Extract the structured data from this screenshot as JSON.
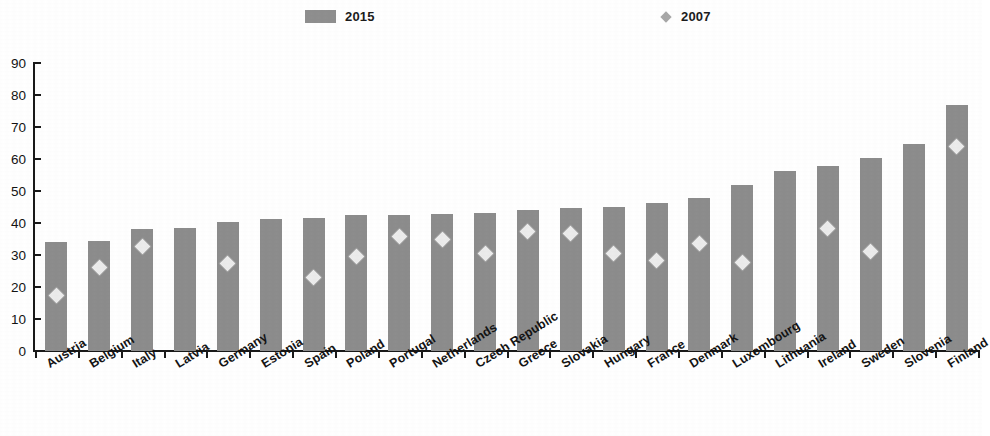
{
  "legend": {
    "position": "top",
    "entries": [
      {
        "label": "2015",
        "marker": "bar-swatch",
        "color": "#8d8d8d"
      },
      {
        "label": "2007",
        "marker": "diamond-marker",
        "color": "#a8a8a8"
      }
    ]
  },
  "axis": {
    "y_ticks": [
      "0",
      "10",
      "20",
      "30",
      "40",
      "50",
      "60",
      "70",
      "80",
      "90"
    ],
    "y_min": 0,
    "y_max": 90,
    "y_step": 10
  },
  "chart_data": {
    "type": "bar",
    "title": "",
    "subtitle": "",
    "xlabel": "",
    "ylabel": "",
    "ylim": [
      0,
      90
    ],
    "ytick_step": 10,
    "grid": false,
    "legend_position": "top",
    "categories": [
      "Austria",
      "Belgium",
      "Italy",
      "Latvia",
      "Germany",
      "Estonia",
      "Spain",
      "Poland",
      "Portugal",
      "Netherlands",
      "Czech Republic",
      "Greece",
      "Slovakia",
      "Hungary",
      "France",
      "Denmark",
      "Luxembourg",
      "Lithuania",
      "Ireland",
      "Sweden",
      "Slovenia",
      "Finland"
    ],
    "series": [
      {
        "name": "2015",
        "type": "bar",
        "color": "#8d8d8d",
        "values": [
          34,
          34.3,
          38.2,
          38.5,
          40.3,
          41.4,
          41.5,
          42.4,
          42.5,
          42.8,
          43,
          44,
          44.6,
          45,
          46.4,
          47.7,
          51.8,
          56.2,
          57.8,
          60.2,
          64.8,
          76.8
        ]
      },
      {
        "name": "2007",
        "type": "scatter",
        "color": "#ececec",
        "marker": "diamond",
        "values": [
          17.2,
          26.2,
          32.8,
          null,
          27.4,
          null,
          23,
          29.6,
          35.8,
          34.7,
          30.5,
          37.5,
          36.6,
          30.5,
          28.4,
          33.6,
          27.8,
          null,
          38.4,
          31.2,
          null,
          64
        ]
      }
    ]
  }
}
